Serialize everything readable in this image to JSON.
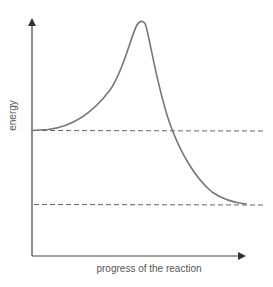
{
  "diagram": {
    "type": "reaction-energy-profile",
    "y_axis_label": "energy",
    "x_axis_label": "progress of the reaction",
    "colors": {
      "axis": "#444444",
      "curve": "#777777",
      "dashed_lines": "#666666",
      "text": "#555555"
    },
    "levels": [
      {
        "name": "reactants-energy-level",
        "style": "dashed"
      },
      {
        "name": "products-energy-level",
        "style": "dashed"
      }
    ],
    "curve": {
      "description": "Energy rises from the reactant level to a single peak (transition state) then falls to a lower product level (exothermic reaction)"
    }
  }
}
